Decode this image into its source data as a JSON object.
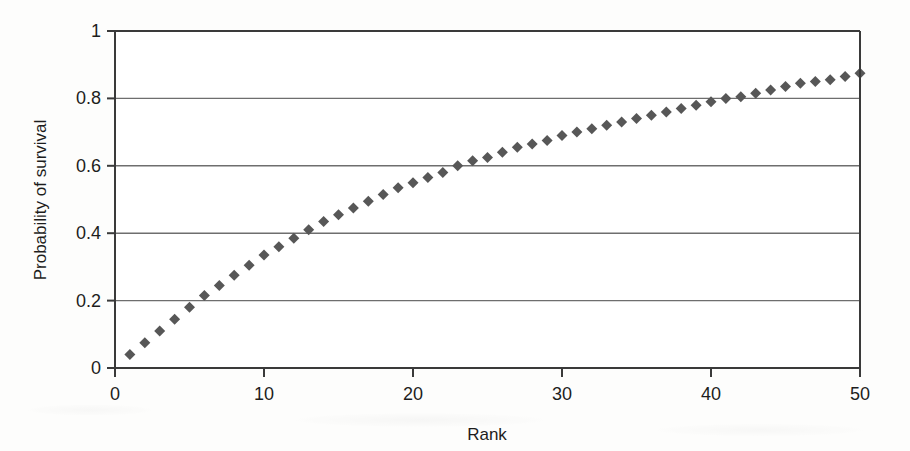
{
  "chart_data": {
    "type": "scatter",
    "title": "",
    "xlabel": "Rank",
    "ylabel": "Probability of survival",
    "xlim": [
      0,
      50
    ],
    "ylim": [
      0,
      1
    ],
    "xticks": [
      0,
      10,
      20,
      30,
      40,
      50
    ],
    "yticks": [
      0,
      0.2,
      0.4,
      0.6,
      0.8,
      1
    ],
    "xtick_labels": [
      "0",
      "10",
      "20",
      "30",
      "40",
      "50"
    ],
    "ytick_labels": [
      "0",
      "0.2",
      "0.4",
      "0.6",
      "0.8",
      "1"
    ],
    "grid": "horizontal",
    "legend": "none",
    "marker": "diamond",
    "marker_color": "#575757",
    "marker_size": 11,
    "axis_color": "#3a3a3a",
    "gridline_color": "#6e6e6e",
    "x": [
      1,
      2,
      3,
      4,
      5,
      6,
      7,
      8,
      9,
      10,
      11,
      12,
      13,
      14,
      15,
      16,
      17,
      18,
      19,
      20,
      21,
      22,
      23,
      24,
      25,
      26,
      27,
      28,
      29,
      30,
      31,
      32,
      33,
      34,
      35,
      36,
      37,
      38,
      39,
      40,
      41,
      42,
      43,
      44,
      45,
      46,
      47,
      48,
      49,
      50
    ],
    "values": [
      0.04,
      0.075,
      0.11,
      0.145,
      0.18,
      0.215,
      0.245,
      0.275,
      0.305,
      0.335,
      0.36,
      0.385,
      0.41,
      0.435,
      0.455,
      0.475,
      0.495,
      0.515,
      0.535,
      0.55,
      0.565,
      0.58,
      0.6,
      0.615,
      0.625,
      0.64,
      0.655,
      0.665,
      0.675,
      0.69,
      0.7,
      0.71,
      0.72,
      0.73,
      0.74,
      0.75,
      0.76,
      0.77,
      0.78,
      0.79,
      0.8,
      0.805,
      0.815,
      0.825,
      0.835,
      0.845,
      0.85,
      0.855,
      0.865,
      0.875
    ],
    "series_name": "Probability of survival by rank"
  }
}
